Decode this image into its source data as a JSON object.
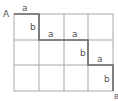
{
  "diagram": {
    "type": "grid-path",
    "grid": {
      "columns": 4,
      "rows": 3
    },
    "start_label": "A",
    "end_label": "B",
    "path_labels": [
      {
        "segment": "horizontal-1",
        "text": "a"
      },
      {
        "segment": "vertical-1",
        "text": "b"
      },
      {
        "segment": "horizontal-2",
        "text": "a"
      },
      {
        "segment": "horizontal-3",
        "text": "a"
      },
      {
        "segment": "vertical-2",
        "text": "b"
      },
      {
        "segment": "horizontal-4",
        "text": "a"
      },
      {
        "segment": "vertical-3",
        "text": "b"
      }
    ],
    "colors": {
      "grid": "#9a9a9a",
      "path": "#6a6a6a",
      "text": "#555555"
    }
  }
}
